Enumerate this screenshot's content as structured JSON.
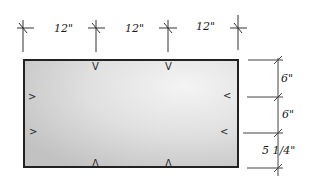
{
  "diagram": {
    "type": "dimensioned-panel-drawing",
    "colors": {
      "line": "#1a1a1a",
      "panel_fill_light": "#f2f2f2",
      "panel_fill_dark": "#c4c4c4",
      "background": "#ffffff"
    },
    "top_dimensions": {
      "tick_x": [
        22,
        96,
        170,
        238
      ],
      "labels": [
        "12\"",
        "12\"",
        "12\""
      ]
    },
    "right_dimensions": {
      "tick_y": [
        60,
        97,
        133,
        168
      ],
      "labels": [
        "6\"",
        "6\"",
        "5 1/4\""
      ]
    },
    "panel": {
      "x": 24,
      "y": 60,
      "width": 214,
      "height": 107
    },
    "markers": {
      "top": [
        "V",
        "V"
      ],
      "bottom": [
        "Λ",
        "Λ"
      ],
      "left": [
        ">",
        ">"
      ],
      "right": [
        "<",
        "<"
      ]
    }
  }
}
